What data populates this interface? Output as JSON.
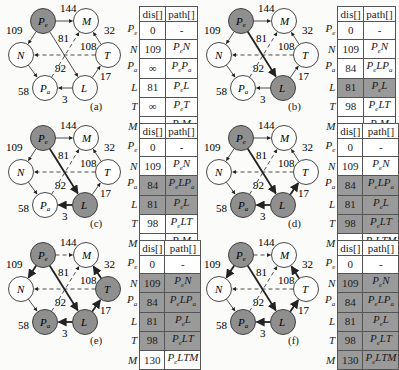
{
  "figure": {
    "nodes": [
      {
        "id": "Pe",
        "label": "P",
        "sub": "e",
        "x": 43,
        "y": 21
      },
      {
        "id": "M",
        "label": "M",
        "sub": "",
        "x": 86,
        "y": 21
      },
      {
        "id": "N",
        "label": "N",
        "sub": "",
        "x": 21,
        "y": 55
      },
      {
        "id": "T",
        "label": "T",
        "sub": "",
        "x": 108,
        "y": 55
      },
      {
        "id": "Pa",
        "label": "P",
        "sub": "a",
        "x": 45,
        "y": 88
      },
      {
        "id": "L",
        "label": "L",
        "sub": "",
        "x": 85,
        "y": 88
      }
    ],
    "edges": [
      {
        "from": "Pe",
        "to": "M",
        "w": "144",
        "lx": 60,
        "ly": 12
      },
      {
        "from": "Pe",
        "to": "N",
        "w": "109",
        "lx": 6,
        "ly": 34
      },
      {
        "from": "Pe",
        "to": "L",
        "w": "81",
        "lx": 58,
        "ly": 42
      },
      {
        "from": "T",
        "to": "M",
        "w": "32",
        "lx": 104,
        "ly": 34
      },
      {
        "from": "T",
        "to": "N",
        "w": "108",
        "lx": 80,
        "ly": 50,
        "dashed": true
      },
      {
        "from": "Pa",
        "to": "M",
        "w": "92",
        "lx": 55,
        "ly": 72,
        "dashed": true
      },
      {
        "from": "N",
        "to": "Pa",
        "w": "58",
        "lx": 18,
        "ly": 95
      },
      {
        "from": "L",
        "to": "Pa",
        "w": "3",
        "lx": 62,
        "ly": 103
      },
      {
        "from": "L",
        "to": "T",
        "w": "17",
        "lx": 100,
        "ly": 80
      }
    ],
    "table_header": [
      "dis[]",
      "path[]"
    ],
    "row_labels": [
      {
        "l": "P",
        "s": "e"
      },
      {
        "l": "N",
        "s": ""
      },
      {
        "l": "P",
        "s": "a"
      },
      {
        "l": "L",
        "s": ""
      },
      {
        "l": "T",
        "s": ""
      },
      {
        "l": "M",
        "s": ""
      }
    ],
    "panels": [
      {
        "caption": "(a)",
        "gray_nodes": [
          "Pe"
        ],
        "bold_edges": [],
        "dashed_extra": [],
        "rows": [
          {
            "dis": "0",
            "path": "-",
            "shaded": false
          },
          {
            "dis": "109",
            "path": "PeN",
            "shaded": false
          },
          {
            "dis": "∞",
            "path": "PePa",
            "shaded": false
          },
          {
            "dis": "81",
            "path": "PeL",
            "shaded": false
          },
          {
            "dis": "∞",
            "path": "PeT",
            "shaded": false
          },
          {
            "dis": "144",
            "path": "PeM",
            "shaded": false
          }
        ]
      },
      {
        "caption": "(b)",
        "gray_nodes": [
          "Pe",
          "L"
        ],
        "bold_edges": [
          "Pe-L"
        ],
        "dashed_extra": [],
        "rows": [
          {
            "dis": "0",
            "path": "-",
            "shaded": false
          },
          {
            "dis": "109",
            "path": "PeN",
            "shaded": false
          },
          {
            "dis": "84",
            "path": "PeLPa",
            "shaded": false
          },
          {
            "dis": "81",
            "path": "PeL",
            "shaded": true
          },
          {
            "dis": "98",
            "path": "PeLT",
            "shaded": false
          },
          {
            "dis": "144",
            "path": "PeM",
            "shaded": false
          }
        ]
      },
      {
        "caption": "(c)",
        "gray_nodes": [
          "Pe",
          "L"
        ],
        "bold_edges": [
          "Pe-L",
          "L-Pa"
        ],
        "dashed_extra": [],
        "rows": [
          {
            "dis": "0",
            "path": "-",
            "shaded": false
          },
          {
            "dis": "109",
            "path": "PeN",
            "shaded": false
          },
          {
            "dis": "84",
            "path": "PeLPa",
            "shaded": true
          },
          {
            "dis": "81",
            "path": "PeL",
            "shaded": true
          },
          {
            "dis": "98",
            "path": "PeLT",
            "shaded": false
          },
          {
            "dis": "144",
            "path": "PeM",
            "shaded": false
          }
        ]
      },
      {
        "caption": "(d)",
        "gray_nodes": [
          "Pe",
          "L",
          "Pa"
        ],
        "bold_edges": [
          "Pe-L",
          "L-Pa",
          "L-T"
        ],
        "dashed_extra": [],
        "rows": [
          {
            "dis": "0",
            "path": "-",
            "shaded": false
          },
          {
            "dis": "109",
            "path": "PeN",
            "shaded": false
          },
          {
            "dis": "84",
            "path": "PeLPa",
            "shaded": true
          },
          {
            "dis": "81",
            "path": "PeL",
            "shaded": true
          },
          {
            "dis": "98",
            "path": "PeLT",
            "shaded": true
          },
          {
            "dis": "130",
            "path": "PeLTM",
            "shaded": false
          }
        ]
      },
      {
        "caption": "(e)",
        "gray_nodes": [
          "Pe",
          "L",
          "Pa",
          "T"
        ],
        "bold_edges": [
          "Pe-L",
          "L-Pa",
          "L-T",
          "T-M",
          "Pe-N"
        ],
        "dashed_extra": [
          "Pe-M"
        ],
        "rows": [
          {
            "dis": "0",
            "path": "-",
            "shaded": false
          },
          {
            "dis": "109",
            "path": "PeN",
            "shaded": true
          },
          {
            "dis": "84",
            "path": "PeLPa",
            "shaded": true
          },
          {
            "dis": "81",
            "path": "PeL",
            "shaded": true
          },
          {
            "dis": "98",
            "path": "PeLT",
            "shaded": true
          },
          {
            "dis": "130",
            "path": "PeLTM",
            "shaded": false
          }
        ]
      },
      {
        "caption": "(f)",
        "gray_nodes": [
          "Pe",
          "L",
          "Pa"
        ],
        "bold_edges": [
          "Pe-L",
          "L-Pa",
          "L-T",
          "T-M",
          "Pe-N"
        ],
        "dashed_extra": [
          "Pe-M"
        ],
        "rows": [
          {
            "dis": "0",
            "path": "-",
            "shaded": false
          },
          {
            "dis": "109",
            "path": "PeN",
            "shaded": true
          },
          {
            "dis": "84",
            "path": "PeLPa",
            "shaded": true
          },
          {
            "dis": "81",
            "path": "PeL",
            "shaded": true
          },
          {
            "dis": "98",
            "path": "PeLT",
            "shaded": true
          },
          {
            "dis": "130",
            "path": "PeLTM",
            "shaded": true
          }
        ]
      }
    ],
    "colors": {
      "gray_node": "#8f8f8f",
      "shade": "#9a9a9a",
      "line": "#222222"
    }
  }
}
